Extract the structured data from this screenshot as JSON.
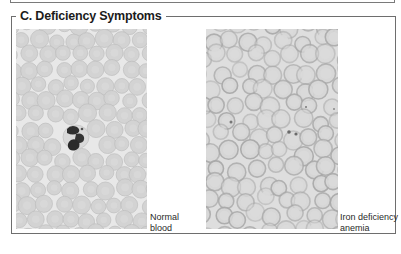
{
  "figure": {
    "section_title": "C. Deficiency Symptoms",
    "panels": [
      {
        "id": "normal",
        "label_line1": "Normal",
        "label_line2": "blood",
        "background": "#e8e8e8",
        "cell_fill": "#d2d2d2",
        "cell_edge": "#bdbdbd",
        "cell_center": "#dcdcdc"
      },
      {
        "id": "iron-deficiency",
        "label_line1": "Iron deficiency",
        "label_line2": "anemia",
        "background": "#dcdcdc",
        "cell_fill": "#d6d6d6",
        "cell_edge": "#a9a9a9",
        "cell_center": "#dadada"
      }
    ]
  }
}
